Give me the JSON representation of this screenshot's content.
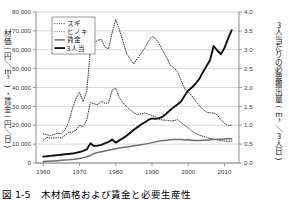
{
  "figure": {
    "caption": "図 1-5　木材価格および賃金と必要生産性",
    "background_color": "#ffffff",
    "grid_color": "#c9c9c9",
    "axis_color": "#808080"
  },
  "chart_data": {
    "type": "line",
    "title": "",
    "xlabel": "",
    "ylabel": "材価(円／m³)・賃金(円／日)",
    "y2label": "3人当たりの必要搬出量(m³／3人日)",
    "xlim": [
      1958,
      2014
    ],
    "ylim": [
      0,
      80000
    ],
    "y2lim": [
      0.0,
      4.0
    ],
    "grid": true,
    "legend_position": "upper-left-inside",
    "xticks": [
      1960,
      1970,
      1980,
      1990,
      2000,
      2010
    ],
    "xtick_labels": [
      "1960",
      "1970",
      "1980",
      "1990",
      "2000",
      "2010"
    ],
    "yticks": [
      0,
      10000,
      20000,
      30000,
      40000,
      50000,
      60000,
      70000,
      80000
    ],
    "ytick_labels": [
      "0",
      "10,000",
      "20,000",
      "30,000",
      "40,000",
      "50,000",
      "60,000",
      "70,000",
      "80,000"
    ],
    "y2ticks": [
      0.0,
      0.5,
      1.0,
      1.5,
      2.0,
      2.5,
      3.0,
      3.5,
      4.0
    ],
    "y2tick_labels": [
      "0.0",
      "0.5",
      "1.0",
      "1.5",
      "2.0",
      "2.5",
      "3.0",
      "3.5",
      "4.0"
    ],
    "x": [
      1960,
      1961,
      1962,
      1963,
      1964,
      1965,
      1966,
      1967,
      1968,
      1969,
      1970,
      1971,
      1972,
      1973,
      1974,
      1975,
      1976,
      1977,
      1978,
      1979,
      1980,
      1981,
      1982,
      1983,
      1984,
      1985,
      1986,
      1987,
      1988,
      1989,
      1990,
      1991,
      1992,
      1993,
      1994,
      1995,
      1996,
      1997,
      1998,
      1999,
      2000,
      2001,
      2002,
      2003,
      2004,
      2005,
      2006,
      2007,
      2008,
      2009,
      2010,
      2011,
      2012
    ],
    "series": [
      {
        "name": "スギ",
        "legend_label": "スギ",
        "axis": "left",
        "style": "dotted",
        "color": "#3a3a3a",
        "unit": "円/m³",
        "values": [
          12000,
          13600,
          13200,
          13300,
          13400,
          13300,
          14600,
          16200,
          16400,
          17300,
          20000,
          19300,
          22800,
          32000,
          31400,
          30800,
          32800,
          31600,
          31800,
          38500,
          39600,
          34500,
          32000,
          29800,
          28200,
          26500,
          25800,
          26000,
          26500,
          25800,
          25200,
          24400,
          23000,
          22800,
          22600,
          22300,
          22400,
          23000,
          21500,
          20000,
          18500,
          17000,
          15800,
          14800,
          14200,
          13600,
          13000,
          12600,
          12300,
          11800,
          11600,
          11500,
          11600
        ]
      },
      {
        "name": "ヒノキ",
        "legend_label": "ヒノキ",
        "axis": "left",
        "style": "dotted",
        "color": "#3a3a3a",
        "unit": "円/m³",
        "values": [
          15500,
          15000,
          14500,
          15200,
          15800,
          15500,
          17500,
          21500,
          28500,
          34000,
          37500,
          32500,
          38000,
          60000,
          63500,
          65000,
          65500,
          61500,
          60500,
          69000,
          76000,
          70500,
          64500,
          58000,
          55000,
          52500,
          55500,
          58000,
          61000,
          64500,
          67000,
          66000,
          63000,
          59500,
          56000,
          52000,
          50500,
          48500,
          44000,
          39500,
          37800,
          35500,
          33000,
          30500,
          28500,
          27000,
          26500,
          26500,
          25500,
          23000,
          21000,
          19800,
          20000
        ]
      },
      {
        "name": "賃金",
        "legend_label": "賃金",
        "axis": "left",
        "style": "solid",
        "color": "#6f6f6f",
        "unit": "円/日",
        "values": [
          800,
          900,
          1000,
          1100,
          1250,
          1400,
          1550,
          1700,
          1900,
          2100,
          2400,
          2800,
          3300,
          4000,
          5000,
          5600,
          6000,
          6400,
          6800,
          7100,
          7500,
          7900,
          8200,
          8500,
          8800,
          9100,
          9400,
          9700,
          10000,
          10400,
          10800,
          11200,
          11600,
          11900,
          12100,
          12300,
          12400,
          12500,
          12400,
          12200,
          12300,
          12100,
          11900,
          11900,
          12000,
          12100,
          12300,
          12500,
          12600,
          12600,
          12700,
          12800,
          12900
        ]
      },
      {
        "name": "3人当",
        "legend_label": "3人当",
        "axis": "right",
        "style": "solid-bold",
        "color": "#111111",
        "unit": "m³/3人日",
        "values": [
          0.17,
          0.18,
          0.19,
          0.2,
          0.21,
          0.22,
          0.23,
          0.24,
          0.25,
          0.27,
          0.29,
          0.32,
          0.36,
          0.52,
          0.45,
          0.46,
          0.48,
          0.52,
          0.56,
          0.62,
          0.54,
          0.6,
          0.66,
          0.72,
          0.8,
          0.88,
          0.95,
          1.02,
          1.08,
          1.14,
          1.18,
          1.17,
          1.19,
          1.23,
          1.31,
          1.4,
          1.48,
          1.55,
          1.63,
          1.78,
          1.92,
          2.0,
          2.1,
          2.22,
          2.4,
          2.56,
          2.72,
          3.1,
          2.98,
          2.88,
          3.05,
          3.3,
          3.52
        ]
      }
    ]
  }
}
